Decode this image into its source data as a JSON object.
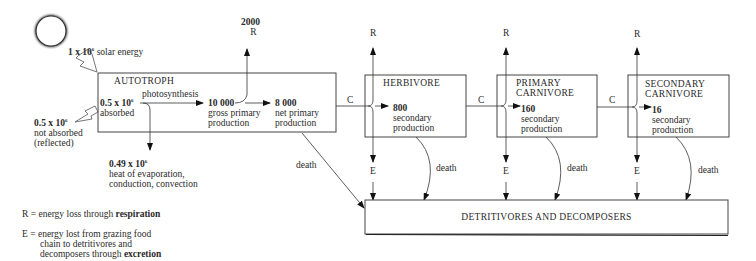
{
  "diagram": {
    "type": "energy-flow",
    "sun": {
      "label_value": "1 x 10",
      "label_exp": "6",
      "label_text": " solar energy"
    },
    "reflected": {
      "value": "0.5 x 10",
      "exp": "6",
      "line1": "not absorbed",
      "line2": "(reflected)"
    },
    "autotroph": {
      "title": "AUTOTROPH",
      "absorbed_value": "0.5 x 10",
      "absorbed_exp": "6",
      "absorbed_label": "absorbed",
      "photosynthesis_label": "photosynthesis",
      "gpp_value": "10 000",
      "gpp_line1": "gross primary",
      "gpp_line2": "production",
      "npp_value": "8 000",
      "npp_line1": "net primary",
      "npp_line2": "production",
      "respiration_value": "2000",
      "respiration_label": "R",
      "heat_value": "0.49 x 10",
      "heat_exp": "6",
      "heat_line1": "heat of evaporation,",
      "heat_line2": "conduction, convection",
      "death_label": "death"
    },
    "herbivore": {
      "title": "HERBIVORE",
      "value": "800",
      "line1": "secondary",
      "line2": "production",
      "r_label": "R",
      "e_label": "E",
      "c_label": "C",
      "death_label": "death"
    },
    "primary_carnivore": {
      "title1": "PRIMARY",
      "title2": "CARNIVORE",
      "value": "160",
      "line1": "secondary",
      "line2": "production",
      "r_label": "R",
      "e_label": "E",
      "c_label": "C",
      "death_label": "death"
    },
    "secondary_carnivore": {
      "title1": "SECONDARY",
      "title2": "CARNIVORE",
      "value": "16",
      "line1": "secondary",
      "line2": "production",
      "r_label": "R",
      "e_label": "E",
      "c_label": "C",
      "death_label": "death"
    },
    "detritivores": {
      "title": "DETRITIVORES AND DECOMPOSERS"
    },
    "legend": {
      "r_prefix": "R = energy loss through ",
      "r_bold": "respiration",
      "e_prefix": "E = energy lost from grazing food",
      "e_line2": "chain to detritivores and",
      "e_line3_prefix": "decomposers through ",
      "e_bold": "excretion"
    }
  }
}
